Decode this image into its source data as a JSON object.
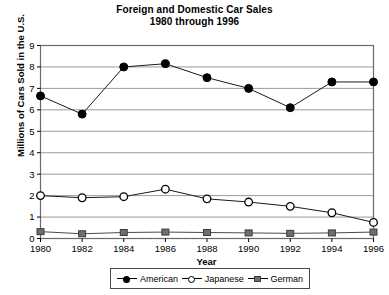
{
  "chart_data": {
    "type": "line",
    "title": "Foreign and Domestic Car Sales",
    "subtitle": "1980 through 1996",
    "xlabel": "Year",
    "ylabel": "Millions of Cars Sold in the U.S.",
    "x": [
      1980,
      1982,
      1984,
      1986,
      1988,
      1990,
      1992,
      1994,
      1996
    ],
    "categories": [
      "1980",
      "1982",
      "1984",
      "1986",
      "1988",
      "1990",
      "1992",
      "1994",
      "1996"
    ],
    "xlim": [
      1980,
      1996
    ],
    "ylim": [
      0,
      9
    ],
    "yticks": [
      "0",
      "1",
      "2",
      "3",
      "4",
      "5",
      "6",
      "7",
      "8",
      "9"
    ],
    "grid": "horizontal",
    "legend_position": "bottom",
    "series": [
      {
        "name": "American",
        "marker": "filled-circle",
        "color": "#000000",
        "values": [
          6.65,
          5.8,
          8.0,
          8.15,
          7.5,
          7.0,
          6.1,
          7.3,
          7.3
        ]
      },
      {
        "name": "Japanese",
        "marker": "open-circle",
        "color": "#000000",
        "values": [
          2.0,
          1.9,
          1.95,
          2.3,
          1.85,
          1.7,
          1.5,
          1.2,
          0.75
        ]
      },
      {
        "name": "German",
        "marker": "filled-square",
        "color": "#6e6e6e",
        "values": [
          0.32,
          0.22,
          0.28,
          0.3,
          0.28,
          0.26,
          0.24,
          0.26,
          0.3
        ]
      }
    ]
  },
  "legend": {
    "items": [
      {
        "label": "American"
      },
      {
        "label": "Japanese"
      },
      {
        "label": "German"
      }
    ]
  },
  "colors": {
    "grid": "#9a9a9a",
    "frame": "#6a6a6a",
    "american": "#000000",
    "japanese": "#000000",
    "german": "#6e6e6e",
    "background": "#ffffff"
  }
}
